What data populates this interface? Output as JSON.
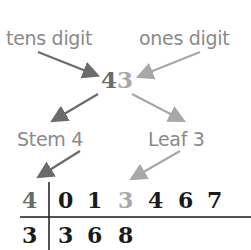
{
  "labels": {
    "tens": "tens digit",
    "ones": "ones digit",
    "stem": "Stem 4",
    "leaf": "Leaf 3"
  },
  "number": {
    "tens": "4",
    "ones": "3"
  },
  "plot": {
    "rows": [
      {
        "stem": "4",
        "leaves": [
          "0",
          "1",
          "3",
          "4",
          "6",
          "7"
        ],
        "highlight_leaf_index": 2
      },
      {
        "stem": "3",
        "leaves": [
          "3",
          "6",
          "8"
        ]
      }
    ]
  },
  "colors": {
    "dark_gray": "#6b6b6b",
    "light_gray": "#a8a8a8",
    "text": "#1a1a1a"
  }
}
